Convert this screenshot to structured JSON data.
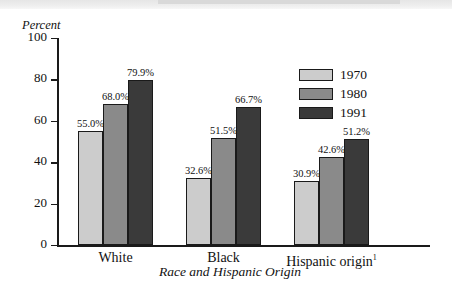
{
  "chart_data": {
    "type": "bar",
    "title": "",
    "xlabel": "Race and Hispanic Origin",
    "ylabel": "Percent",
    "ylim": [
      0,
      100
    ],
    "yticks": [
      0,
      20,
      40,
      60,
      80,
      100
    ],
    "grid": false,
    "legend_position": "upper-right-inside",
    "categories": [
      "White",
      "Black",
      "Hispanic origin"
    ],
    "category_footnotes": [
      "",
      "",
      "1"
    ],
    "series": [
      {
        "name": "1970",
        "color": "#cccccc",
        "values": [
          55.0,
          32.6,
          30.9
        ],
        "labels": [
          "55.0%",
          "32.6%",
          "30.9%"
        ]
      },
      {
        "name": "1980",
        "color": "#8a8a8a",
        "values": [
          68.0,
          51.5,
          42.6
        ],
        "labels": [
          "68.0%",
          "51.5%",
          "42.6%"
        ]
      },
      {
        "name": "1991",
        "color": "#3a3a3a",
        "values": [
          79.9,
          66.7,
          51.2
        ],
        "labels": [
          "79.9%",
          "66.7%",
          "51.2%"
        ]
      }
    ]
  },
  "axis": {
    "y_title": "Percent",
    "x_title": "Race and Hispanic Origin",
    "y_tick_labels": [
      "100",
      "80",
      "60",
      "40",
      "20",
      "0"
    ]
  },
  "legend": {
    "items": [
      {
        "label": "1970"
      },
      {
        "label": "1980"
      },
      {
        "label": "1991"
      }
    ]
  },
  "groups": [
    {
      "label": "White",
      "footnote": ""
    },
    {
      "label": "Black",
      "footnote": ""
    },
    {
      "label": "Hispanic origin",
      "footnote": "1"
    }
  ]
}
